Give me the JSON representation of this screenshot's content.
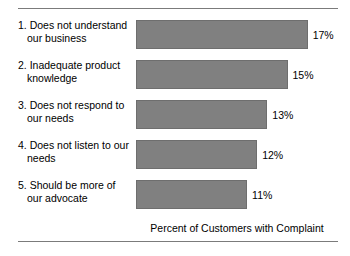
{
  "chart_data": {
    "type": "bar",
    "orientation": "horizontal",
    "title": "",
    "xlabel": "Percent of Customers with Complaint",
    "ylabel": "",
    "categories": [
      "1. Does not understand our business",
      "2. Inadequate product knowledge",
      "3. Does not respond to our needs",
      "4. Does not listen to our needs",
      "5. Should be more of our advocate"
    ],
    "category_lines": [
      [
        "1. Does not understand",
        "our business"
      ],
      [
        "2. Inadequate product",
        "knowledge"
      ],
      [
        "3. Does not respond to",
        "our needs"
      ],
      [
        "4. Does not listen to our",
        "needs"
      ],
      [
        "5. Should be more of",
        "our advocate"
      ]
    ],
    "values": [
      17,
      15,
      13,
      12,
      11
    ],
    "value_labels": [
      "17%",
      "15%",
      "13%",
      "12%",
      "11%"
    ],
    "xlim": [
      0,
      20
    ],
    "grid": false,
    "legend": null,
    "bar_color": "#808080",
    "bar_border_color": "#6e6e6e"
  },
  "rules": {
    "top": "horizontal-rule",
    "bottom": "horizontal-rule"
  }
}
